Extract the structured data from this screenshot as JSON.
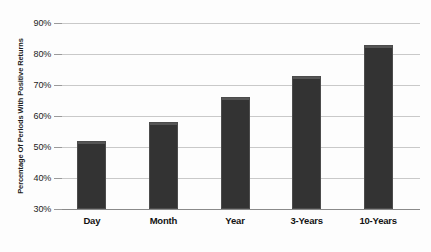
{
  "chart_data": {
    "type": "bar",
    "title": "",
    "xlabel": "",
    "ylabel": "Percentage Of Periods With Positive Returns",
    "categories": [
      "Day",
      "Month",
      "Year",
      "3-Years",
      "10-Years"
    ],
    "values": [
      52,
      58,
      66,
      73,
      83
    ],
    "ylim": [
      30,
      90
    ],
    "ytick_labels": [
      "90%",
      "80%",
      "70%",
      "60%",
      "50%",
      "40%",
      "30%"
    ],
    "ytick_values": [
      90,
      80,
      70,
      60,
      50,
      40,
      30
    ],
    "grid": true,
    "legend": "none",
    "bar_color": "#333333",
    "gridline_color": "#c9c9c9",
    "background_color": "#fdfdfd",
    "text_color": "#1a1a1a"
  }
}
